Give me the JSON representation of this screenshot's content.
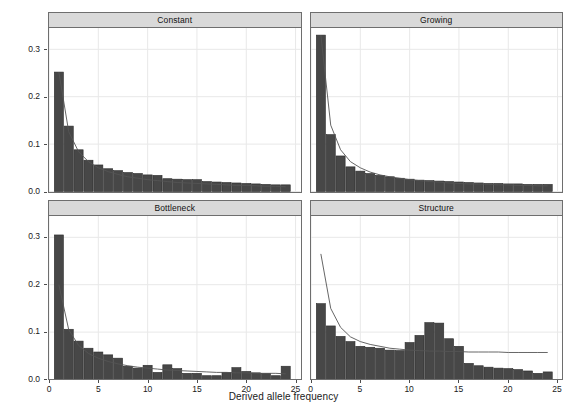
{
  "figure": {
    "xlabel": "Derived allele frequency",
    "ylabel": "Site density",
    "bar_color": "#474747",
    "bar_edge_color": "#2b2b2b",
    "curve_color": "#555555",
    "strip_bg_color": "#d9d9d9",
    "grid_color": "#e8e8e8",
    "panel_border_color": "#6e6e6e"
  },
  "axes": {
    "y_ticks": [
      "0.0",
      "0.1",
      "0.2",
      "0.3"
    ],
    "y_tick_values": [
      0.0,
      0.1,
      0.2,
      0.3
    ],
    "x_ticks": [
      "0",
      "5",
      "10",
      "15",
      "20",
      "25"
    ],
    "x_tick_values": [
      0,
      5,
      10,
      15,
      20,
      25
    ],
    "xlim": [
      0,
      25.5
    ],
    "ylim": [
      0,
      0.345
    ]
  },
  "panels": [
    {
      "id": "constant",
      "label": "Constant"
    },
    {
      "id": "growing",
      "label": "Growing"
    },
    {
      "id": "bottleneck",
      "label": "Bottleneck"
    },
    {
      "id": "structure",
      "label": "Structure"
    }
  ],
  "chart_data": {
    "type": "bar",
    "title": "",
    "xlabel": "Derived allele frequency",
    "ylabel": "Site density",
    "xlim": [
      0,
      25.5
    ],
    "ylim": [
      0,
      0.345
    ],
    "grid": true,
    "legend": "none",
    "facets": [
      "Constant",
      "Growing",
      "Bottleneck",
      "Structure"
    ],
    "facet_layout": "2x2",
    "categories": [
      1,
      2,
      3,
      4,
      5,
      6,
      7,
      8,
      9,
      10,
      11,
      12,
      13,
      14,
      15,
      16,
      17,
      18,
      19,
      20,
      21,
      22,
      23,
      24
    ],
    "series": [
      {
        "name": "Constant",
        "facet": "Constant",
        "bars": [
          0.252,
          0.138,
          0.088,
          0.066,
          0.056,
          0.048,
          0.044,
          0.04,
          0.038,
          0.035,
          0.034,
          0.027,
          0.026,
          0.025,
          0.025,
          0.021,
          0.02,
          0.019,
          0.018,
          0.017,
          0.016,
          0.015,
          0.014,
          0.014
        ],
        "curve": [
          0.252,
          0.126,
          0.084,
          0.063,
          0.05,
          0.042,
          0.036,
          0.031,
          0.028,
          0.025,
          0.023,
          0.021,
          0.019,
          0.018,
          0.017,
          0.016,
          0.015,
          0.014,
          0.013,
          0.013,
          0.012,
          0.011,
          0.011,
          0.01
        ],
        "curve_note": "theoretical neutral 1/x expectation"
      },
      {
        "name": "Growing",
        "facet": "Growing",
        "bars": [
          0.33,
          0.12,
          0.075,
          0.052,
          0.043,
          0.038,
          0.034,
          0.031,
          0.028,
          0.026,
          0.024,
          0.023,
          0.022,
          0.021,
          0.02,
          0.019,
          0.018,
          0.017,
          0.017,
          0.016,
          0.016,
          0.015,
          0.015,
          0.015
        ],
        "curve": [
          0.33,
          0.14,
          0.088,
          0.063,
          0.05,
          0.041,
          0.035,
          0.031,
          0.028,
          0.025,
          0.023,
          0.021,
          0.02,
          0.018,
          0.017,
          0.016,
          0.016,
          0.015,
          0.014,
          0.014,
          0.013,
          0.013,
          0.012,
          0.012
        ],
        "curve_note": "theoretical neutral 1/x expectation"
      },
      {
        "name": "Bottleneck",
        "facet": "Bottleneck",
        "bars": [
          0.305,
          0.106,
          0.081,
          0.066,
          0.058,
          0.052,
          0.045,
          0.028,
          0.024,
          0.03,
          0.015,
          0.031,
          0.023,
          0.013,
          0.013,
          0.008,
          0.008,
          0.015,
          0.025,
          0.017,
          0.014,
          0.013,
          0.008,
          0.028
        ],
        "curve": [
          0.2,
          0.105,
          0.072,
          0.055,
          0.045,
          0.038,
          0.033,
          0.029,
          0.026,
          0.024,
          0.022,
          0.02,
          0.019,
          0.018,
          0.017,
          0.016,
          0.015,
          0.015,
          0.014,
          0.014,
          0.013,
          0.013,
          0.013,
          0.012
        ],
        "curve_note": "theoretical neutral 1/x expectation"
      },
      {
        "name": "Structure",
        "facet": "Structure",
        "bars": [
          0.16,
          0.113,
          0.091,
          0.08,
          0.07,
          0.068,
          0.066,
          0.062,
          0.061,
          0.078,
          0.093,
          0.12,
          0.119,
          0.086,
          0.07,
          0.034,
          0.029,
          0.026,
          0.024,
          0.023,
          0.021,
          0.018,
          0.013,
          0.016
        ],
        "curve": [
          0.265,
          0.15,
          0.11,
          0.09,
          0.08,
          0.074,
          0.07,
          0.066,
          0.064,
          0.062,
          0.061,
          0.06,
          0.06,
          0.059,
          0.059,
          0.058,
          0.058,
          0.058,
          0.058,
          0.057,
          0.057,
          0.057,
          0.057,
          0.057
        ],
        "curve_note": "theoretical neutral expectation under structure"
      }
    ]
  }
}
